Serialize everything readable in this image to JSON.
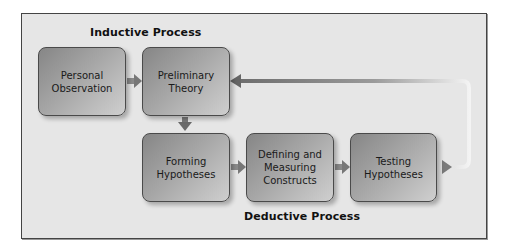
{
  "diagram": {
    "sections": {
      "inductive": "Inductive Process",
      "deductive": "Deductive Process"
    },
    "nodes": [
      {
        "id": "personal-observation",
        "label": "Personal\nObservation"
      },
      {
        "id": "preliminary-theory",
        "label": "Preliminary\nTheory"
      },
      {
        "id": "forming-hypotheses",
        "label": "Forming\nHypotheses"
      },
      {
        "id": "defining-measuring-constructs",
        "label": "Defining and\nMeasuring\nConstructs"
      },
      {
        "id": "testing-hypotheses",
        "label": "Testing\nHypotheses"
      }
    ],
    "edges": [
      {
        "from": "personal-observation",
        "to": "preliminary-theory",
        "direction": "right"
      },
      {
        "from": "preliminary-theory",
        "to": "forming-hypotheses",
        "direction": "down"
      },
      {
        "from": "forming-hypotheses",
        "to": "defining-measuring-constructs",
        "direction": "right"
      },
      {
        "from": "defining-measuring-constructs",
        "to": "testing-hypotheses",
        "direction": "right"
      },
      {
        "from": "testing-hypotheses",
        "to": "preliminary-theory",
        "direction": "feedback-loop"
      }
    ],
    "colors": {
      "frame_bg": "#e6e6e6",
      "frame_border": "#444444",
      "node_dark": "#868686",
      "node_light": "#cfcfcf",
      "arrow": "#6e6e6e"
    }
  }
}
